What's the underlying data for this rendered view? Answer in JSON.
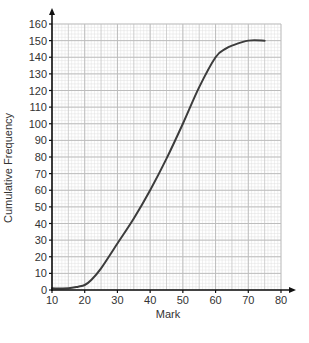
{
  "chart_data": {
    "type": "line",
    "title": "",
    "xlabel": "Mark",
    "ylabel": "Cumulative Frequency",
    "xlim": [
      10,
      80
    ],
    "ylim": [
      0,
      160
    ],
    "x_ticks": [
      10,
      20,
      30,
      40,
      50,
      60,
      70,
      80
    ],
    "y_ticks": [
      0,
      10,
      20,
      30,
      40,
      50,
      60,
      70,
      80,
      90,
      100,
      110,
      120,
      130,
      140,
      150,
      160
    ],
    "grid": true,
    "grid_minor_x_step": 1,
    "grid_minor_y_step": 2,
    "legend": null,
    "series": [
      {
        "name": "Cumulative frequency curve",
        "x": [
          10,
          15,
          18,
          20,
          22,
          25,
          30,
          35,
          40,
          45,
          50,
          55,
          60,
          63,
          65,
          70,
          75
        ],
        "values": [
          1,
          1,
          2,
          3,
          6,
          13,
          28,
          43,
          60,
          79,
          100,
          122,
          140,
          145,
          147,
          150,
          150
        ]
      }
    ]
  },
  "colors": {
    "background": "#ffffff",
    "curve": "#3c3c3c",
    "axis": "#111111",
    "grid_major": "#bdbdbd",
    "grid_minor": "#e0e0e0",
    "text": "#333333"
  }
}
